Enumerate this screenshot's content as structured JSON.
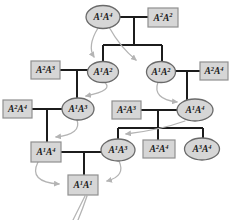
{
  "diagram": {
    "colors": {
      "background": "#ffffff",
      "node_fill": "#d6d6d6",
      "rect_border": "#8f8f8f",
      "ellipse_border": "#6a6a6a",
      "pedigree_line": "#1c1c1c",
      "arrow": "#b4b4b4",
      "text": "#1a1a1a"
    },
    "nodes": [
      {
        "id": "gen1-female",
        "shape": "ellipse",
        "cx": 103,
        "cy": 17,
        "rx": 17,
        "ry": 11.5,
        "label": "A¹A⁴",
        "alleles": [
          [
            "A",
            "1"
          ],
          [
            "A",
            "4"
          ]
        ]
      },
      {
        "id": "gen1-male",
        "shape": "rect",
        "x": 148,
        "y": 8,
        "w": 30,
        "h": 19,
        "label": "A²A²",
        "alleles": [
          [
            "A",
            "2"
          ],
          [
            "A",
            "2"
          ]
        ]
      },
      {
        "id": "gen2-left-male",
        "shape": "rect",
        "x": 31,
        "y": 61,
        "w": 29,
        "h": 18,
        "label": "A²A³",
        "alleles": [
          [
            "A",
            "2"
          ],
          [
            "A",
            "3"
          ]
        ]
      },
      {
        "id": "gen2-left-female",
        "shape": "ellipse",
        "cx": 103,
        "cy": 72,
        "rx": 15.5,
        "ry": 10.5,
        "label": "A¹A²",
        "alleles": [
          [
            "A",
            "1"
          ],
          [
            "A",
            "2"
          ]
        ]
      },
      {
        "id": "gen2-right-female",
        "shape": "ellipse",
        "cx": 161,
        "cy": 72,
        "rx": 14.5,
        "ry": 10.5,
        "label": "A¹A²",
        "alleles": [
          [
            "A",
            "1"
          ],
          [
            "A",
            "2"
          ]
        ]
      },
      {
        "id": "gen2-right-male",
        "shape": "rect",
        "x": 200,
        "y": 62,
        "w": 28,
        "h": 18,
        "label": "A²A⁴",
        "alleles": [
          [
            "A",
            "2"
          ],
          [
            "A",
            "4"
          ]
        ]
      },
      {
        "id": "gen3-left-male",
        "shape": "rect",
        "x": 3,
        "y": 100,
        "w": 29,
        "h": 18,
        "label": "A²A⁴",
        "alleles": [
          [
            "A",
            "2"
          ],
          [
            "A",
            "4"
          ]
        ]
      },
      {
        "id": "gen3-left-female",
        "shape": "ellipse",
        "cx": 78,
        "cy": 109,
        "rx": 16,
        "ry": 11,
        "label": "A¹A³",
        "alleles": [
          [
            "A",
            "1"
          ],
          [
            "A",
            "3"
          ]
        ]
      },
      {
        "id": "gen3-right-male",
        "shape": "rect",
        "x": 112,
        "y": 101,
        "w": 29,
        "h": 18,
        "label": "A²A³",
        "alleles": [
          [
            "A",
            "2"
          ],
          [
            "A",
            "3"
          ]
        ]
      },
      {
        "id": "gen3-right-female",
        "shape": "ellipse",
        "cx": 195,
        "cy": 110,
        "rx": 18,
        "ry": 11,
        "label": "A¹A⁴",
        "alleles": [
          [
            "A",
            "1"
          ],
          [
            "A",
            "4"
          ]
        ]
      },
      {
        "id": "gen4-left-male",
        "shape": "rect",
        "x": 31,
        "y": 142,
        "w": 30,
        "h": 20,
        "label": "A¹A⁴",
        "alleles": [
          [
            "A",
            "1"
          ],
          [
            "A",
            "4"
          ]
        ]
      },
      {
        "id": "gen4-left-female",
        "shape": "ellipse",
        "cx": 118,
        "cy": 150,
        "rx": 17,
        "ry": 11,
        "label": "A¹A³",
        "alleles": [
          [
            "A",
            "1"
          ],
          [
            "A",
            "3"
          ]
        ]
      },
      {
        "id": "gen4-sib-male",
        "shape": "rect",
        "x": 143,
        "y": 140,
        "w": 32,
        "h": 18,
        "label": "A²A⁴",
        "alleles": [
          [
            "A",
            "2"
          ],
          [
            "A",
            "4"
          ]
        ]
      },
      {
        "id": "gen4-sib-female",
        "shape": "ellipse",
        "cx": 202,
        "cy": 149,
        "rx": 17.5,
        "ry": 11,
        "label": "A³A⁴",
        "alleles": [
          [
            "A",
            "3"
          ],
          [
            "A",
            "4"
          ]
        ]
      },
      {
        "id": "gen5-child",
        "shape": "rect",
        "x": 68,
        "y": 175,
        "w": 30,
        "h": 20,
        "label": "A¹A¹",
        "alleles": [
          [
            "A",
            "1"
          ],
          [
            "A",
            "1"
          ]
        ]
      }
    ],
    "pedigree_lines": [
      {
        "id": "gen1-mating-line",
        "d": "M120,17 H148"
      },
      {
        "id": "gen1-descent-line",
        "d": "M134,17 V45"
      },
      {
        "id": "gen2-sibling-bar",
        "d": "M103,45 H162"
      },
      {
        "id": "gen2-left-child-drop",
        "d": "M103,45 V61"
      },
      {
        "id": "gen2-right-child-drop",
        "d": "M162,45 V62"
      },
      {
        "id": "gen2-left-mating-line",
        "d": "M60,70 H88"
      },
      {
        "id": "gen3-left-descent-line",
        "d": "M77,70 V98"
      },
      {
        "id": "gen2-right-mating-line",
        "d": "M175,71 H200"
      },
      {
        "id": "gen3-right-descent-line",
        "d": "M187,71 V100"
      },
      {
        "id": "gen3-left-mating-line",
        "d": "M32,109 H62"
      },
      {
        "id": "gen4-left-descent-line",
        "d": "M47,109 V142"
      },
      {
        "id": "gen3-right-mating-line",
        "d": "M141,110 H177"
      },
      {
        "id": "gen4-right-descent-line",
        "d": "M158,110 V128"
      },
      {
        "id": "gen4-sibling-bar",
        "d": "M118,128 H203"
      },
      {
        "id": "gen4-female-drop",
        "d": "M118,128 V139"
      },
      {
        "id": "gen4-sib-male-drop",
        "d": "M158,128 V140"
      },
      {
        "id": "gen4-sib-female-drop",
        "d": "M203,128 V138"
      },
      {
        "id": "gen4-mating-line",
        "d": "M61,152 H101"
      },
      {
        "id": "gen5-descent-line",
        "d": "M84,152 V175"
      }
    ],
    "arrows": [
      {
        "id": "gamete-arrow-gen1-to-gen2-left",
        "d": "M98,28 Q87,46 94,57",
        "head": true
      },
      {
        "id": "gamete-arrow-gen1-to-gen2-right",
        "d": "M109,27 Q120,47 136,60",
        "head": true
      },
      {
        "id": "gamete-arrow-gen2left-to-gen3left",
        "d": "M104,82 Q115,90 86,96",
        "head": true
      },
      {
        "id": "gamete-arrow-gen2right-to-gen3right",
        "d": "M158,82 Q152,99 177,102",
        "head": true
      },
      {
        "id": "gamete-arrow-gen3left-to-gen4left",
        "d": "M77,120 Q82,134 56,137",
        "head": true
      },
      {
        "id": "gamete-arrow-gen3right-to-gen4female",
        "d": "M185,121 Q160,130 126,134",
        "head": true
      },
      {
        "id": "gamete-arrow-gen4male-to-gen5",
        "d": "M38,162 Q28,182 59,184",
        "head": true
      },
      {
        "id": "gamete-arrow-gen4female-to-gen5",
        "d": "M119,161 Q126,176 107,181",
        "head": true
      },
      {
        "id": "gamete-tail-line-1",
        "d": "M85,196 Q79,208 73,220",
        "head": false
      },
      {
        "id": "gamete-tail-line-2",
        "d": "M87,196 Q83,208 78,220",
        "head": false
      }
    ]
  }
}
